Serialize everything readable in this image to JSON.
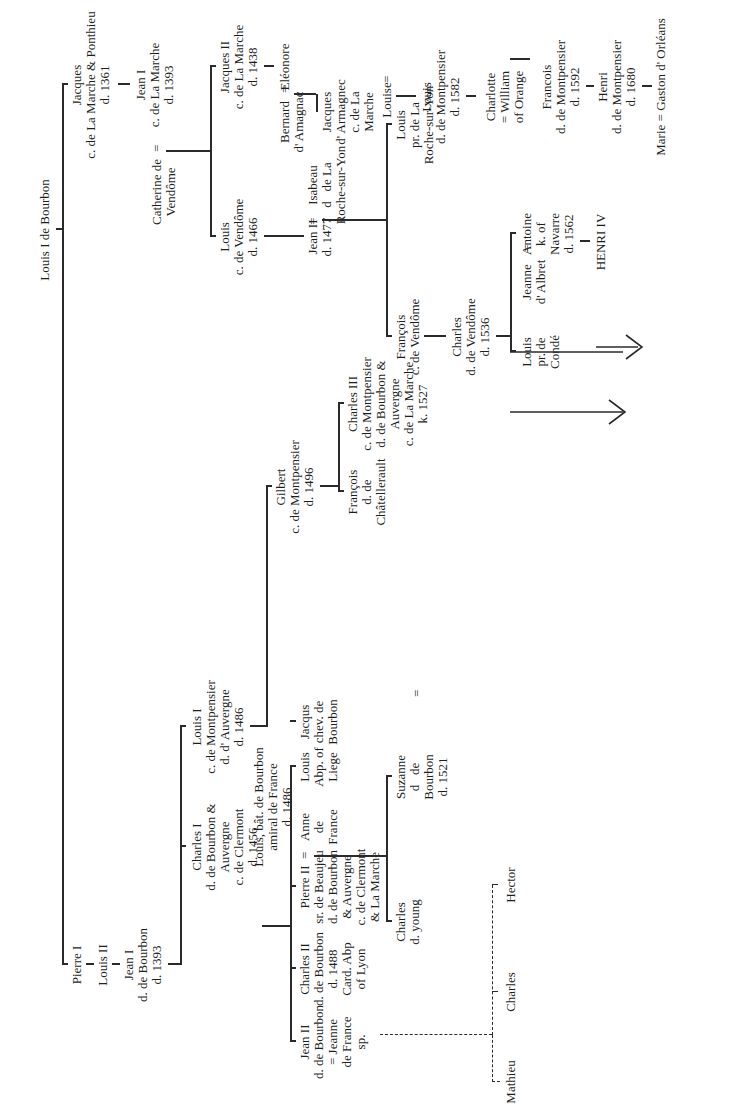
{
  "nodes": {
    "louis1_bourbon": "Louis I de Bourbon",
    "jacques_marche": "Jacques\nc. de La Marche & Ponthieu\nd. 1361",
    "jean1_marche": "Jean I\nc. de La Marche\nd. 1393",
    "catherine_vendome": "Catherine de\nVendôme",
    "jacques2_marche": "Jacques II\nc. de La Marche\nd. 1438",
    "louis_vendome": "Louis\nc. de Vendôme\nd. 1466",
    "eleonore": "Eléonore",
    "bernard_armagnac": "Bernard\nd' Amagnac",
    "jacques_armagnac": "Jacques\nd' Armagnec\nc. de La\nMarche",
    "isabeau": "Isabeau\nd   de La\nRoche-sur-Yon",
    "jean2_vendome": "Jean II\nd. 1477",
    "louis_roche": "Louis\npr. de La\nRoche-sur-Yon",
    "francois_vendome": "François\nc. de Vendôme",
    "charles_vendome": "Charles\nd. de Vendôme\nd. 1536",
    "antoine": "Antoine\nk. of\nNavarre\nd. 1562",
    "jeanne_albret": "Jeanne\nd' Albret",
    "louis_conde": "Louis\npr. de\nCondé",
    "henri4": "HENRI IV",
    "louise": "Louise",
    "louis_montpensier_1582": "Louis\nd. de Montpensier\nd. 1582",
    "charlotte": "Charlotte\n= William\nof Orange",
    "francois_montpensier": "Francois\nd. de Montpensier\nd. 1592",
    "henri_montpensier": "Henri\nd. de Montpensier\nd. 1680",
    "marie": "Marie = Gaston d' Orléans",
    "pierre1": "Pierre I",
    "louis2": "Louis II",
    "jean1_bourbon": "Jean I\nd. de Bourbon\nd. 1393",
    "louis1_montpensier": "Louis I\nc. de Montpensier\nd. d' Auvergne\nd. 1486",
    "gilbert": "Gilbert\nc. de Montpensier\nd. 1496",
    "charles3": "Charles III\nc. de Montpensier\nd. de Bourbon &\nAuvergne\nc. de La Marche\nk. 1527",
    "francois_chatellerault": "François\nd. de\nChâtellerault",
    "charles1": "Charles I\nd. de Bourbon &\nAuvergne\nc. de Clermont\nd. 1456",
    "louis_bat": "Louis, bât. de Bourbon\namiral de France\nd. 1486",
    "jean2_bourbon": "Jean II\nd. de Bourbon\n= Jeanne\nde France\nsp.",
    "charles2": "Charles II\nd. de Bourbon\nd. 1488\nCard. Abp\nof Lyon",
    "pierre2": "Pierre II\nsr. de Beaujeu\nd. de Bourbon\n& Auvergne\nc. de Clermont\n& La Marche",
    "anne_france": "Anne\nde\nFrance",
    "louis_liege": "Louis\nAbp. of\nLiege",
    "jacqus_bourbon": "Jacqus\nchev. de\nBourbon",
    "charles_young": "Charles\nd. young",
    "suzanne": "Suzanne\nd   de\nBourbon\nd. 1521",
    "mathieu": "Mathieu",
    "charles_bastard": "Charles",
    "hector": "Hector"
  },
  "symbols": {
    "marriage": "=",
    "dame_sup": "me"
  }
}
